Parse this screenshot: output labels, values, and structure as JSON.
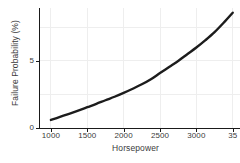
{
  "chart_data": {
    "type": "line",
    "title": "",
    "xlabel": "Horsepower",
    "ylabel": "Failure Probability (%)",
    "xlim": [
      850,
      3600
    ],
    "ylim": [
      0,
      8.95
    ],
    "grid": true,
    "legend": "none",
    "xticks": [
      1000,
      1500,
      2000,
      2500,
      3000,
      3500
    ],
    "xticklabels": [
      "1000",
      "1500",
      "2000",
      "2500",
      "3000",
      "35"
    ],
    "yticks": [
      0,
      5
    ],
    "yticklabels": [
      "0",
      "5"
    ],
    "series": [
      {
        "name": "Failure Probability",
        "color": "#1c1c1c",
        "x": [
          1000,
          1125,
          1250,
          1375,
          1500,
          1625,
          1750,
          1875,
          2000,
          2125,
          2250,
          2375,
          2500,
          2625,
          2750,
          2875,
          3000,
          3125,
          3250,
          3375,
          3500
        ],
        "values": [
          0.6,
          0.83,
          1.06,
          1.3,
          1.55,
          1.8,
          2.07,
          2.33,
          2.62,
          2.93,
          3.26,
          3.64,
          4.1,
          4.55,
          5.0,
          5.5,
          6.0,
          6.55,
          7.15,
          7.85,
          8.6
        ]
      }
    ]
  }
}
